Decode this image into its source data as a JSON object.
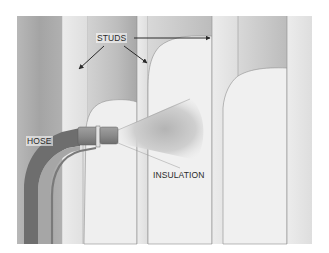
{
  "figure": {
    "type": "illustration",
    "labels": {
      "studs": "STUDS",
      "hose": "HOSE",
      "insulation": "INSULATION"
    },
    "colors": {
      "background": "#ffffff",
      "cavity_dark": "#a9a9a9",
      "cavity_mid": "#c4c4c4",
      "stud_face": "#e6e6e6",
      "insulation": "#f1f1f1",
      "hose_dark": "#6e6e6e",
      "hose_light": "#9d9d9d",
      "nozzle": "#888888",
      "outline": "#8a8a8a",
      "arrow": "#2a2a2a"
    }
  }
}
